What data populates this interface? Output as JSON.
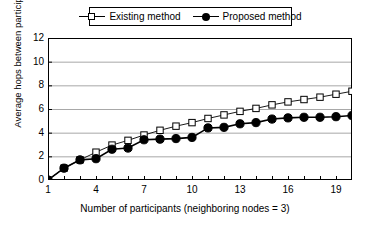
{
  "chart_data": {
    "type": "line",
    "title": "",
    "xlabel": "Number of participants (neighboring nodes = 3)",
    "ylabel": "Average hops between participants",
    "x": [
      1,
      2,
      3,
      4,
      5,
      6,
      7,
      8,
      9,
      10,
      11,
      12,
      13,
      14,
      15,
      16,
      17,
      18,
      19,
      20
    ],
    "xlim": [
      1,
      20
    ],
    "ylim": [
      0,
      12
    ],
    "xticks": [
      1,
      4,
      7,
      10,
      13,
      16,
      19
    ],
    "xtick_labels": [
      "1",
      "4",
      "7",
      "10",
      "13",
      "16",
      "19"
    ],
    "yticks": [
      0,
      2,
      4,
      6,
      8,
      10,
      12
    ],
    "ytick_labels": [
      "0",
      "2",
      "4",
      "6",
      "8",
      "10",
      "12"
    ],
    "grid": "horizontal",
    "legend_position": "top-center",
    "series": [
      {
        "name": "Existing method",
        "marker": "open-square",
        "color": "#000000",
        "values": [
          0,
          1.0,
          1.7,
          2.35,
          2.95,
          3.35,
          3.8,
          4.2,
          4.55,
          4.85,
          5.2,
          5.5,
          5.8,
          6.05,
          6.35,
          6.6,
          6.8,
          7.0,
          7.25,
          7.5
        ]
      },
      {
        "name": "Proposed method",
        "marker": "filled-circle",
        "color": "#000000",
        "values": [
          0,
          1.0,
          1.7,
          1.8,
          2.6,
          2.7,
          3.4,
          3.45,
          3.5,
          3.6,
          4.4,
          4.45,
          4.75,
          4.85,
          5.15,
          5.25,
          5.3,
          5.3,
          5.35,
          5.45
        ]
      }
    ]
  },
  "legend": {
    "entries": [
      {
        "label": "Existing method",
        "marker": "open-square"
      },
      {
        "label": "Proposed method",
        "marker": "filled-circle"
      }
    ]
  },
  "axes": {
    "x_title": "Number of participants (neighboring nodes = 3)",
    "y_title": "Average hops between participants"
  },
  "colors": {
    "axis": "#000000",
    "grid": "#a8a8a8",
    "background": "#ffffff",
    "series": "#000000"
  }
}
